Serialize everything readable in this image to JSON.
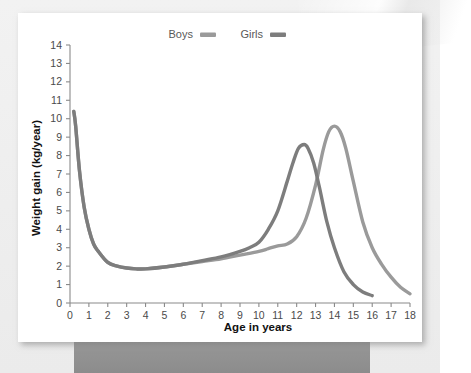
{
  "figure": {
    "background_color": "#efefef",
    "card_color": "#ffffff",
    "pedestal_color": "#939393"
  },
  "legend": {
    "position": "top-center",
    "entries": [
      {
        "label": "Boys",
        "color": "#9a9a9a",
        "swatch_name": "boys-swatch"
      },
      {
        "label": "Girls",
        "color": "#7d7d7d",
        "swatch_name": "girls-swatch"
      }
    ]
  },
  "axes": {
    "x_title": "Age in years",
    "y_title": "Weight gain (kg/year)",
    "x_ticks": [
      "0",
      "1",
      "2",
      "3",
      "4",
      "5",
      "6",
      "7",
      "8",
      "9",
      "10",
      "11",
      "12",
      "13",
      "14",
      "15",
      "16",
      "17",
      "18"
    ],
    "y_ticks": [
      "0",
      "1",
      "2",
      "3",
      "4",
      "5",
      "6",
      "7",
      "8",
      "9",
      "10",
      "11",
      "12",
      "13",
      "14"
    ],
    "axis_color": "#8a8a8a"
  },
  "chart_data": {
    "type": "line",
    "title": "",
    "xlabel": "Age in years",
    "ylabel": "Weight gain (kg/year)",
    "xlim": [
      0,
      18
    ],
    "ylim": [
      0,
      14
    ],
    "grid": false,
    "legend_position": "top-center",
    "x_ticks": [
      0,
      1,
      2,
      3,
      4,
      5,
      6,
      7,
      8,
      9,
      10,
      11,
      12,
      13,
      14,
      15,
      16,
      17,
      18
    ],
    "y_ticks": [
      0,
      1,
      2,
      3,
      4,
      5,
      6,
      7,
      8,
      9,
      10,
      11,
      12,
      13,
      14
    ],
    "series": [
      {
        "name": "Boys",
        "color": "#9a9a9a",
        "x": [
          0.2,
          0.3,
          0.5,
          0.75,
          1.0,
          1.25,
          1.5,
          2.0,
          2.5,
          3.0,
          3.5,
          4.0,
          5.0,
          6.0,
          7.0,
          8.0,
          9.0,
          10.0,
          10.5,
          11.0,
          11.5,
          12.0,
          12.5,
          13.0,
          13.4,
          13.7,
          14.0,
          14.3,
          14.6,
          15.0,
          15.5,
          16.0,
          16.5,
          17.0,
          17.5,
          18.0
        ],
        "y": [
          10.4,
          9.6,
          7.2,
          5.2,
          4.0,
          3.2,
          2.8,
          2.2,
          2.0,
          1.9,
          1.85,
          1.85,
          1.95,
          2.1,
          2.25,
          2.4,
          2.6,
          2.8,
          2.95,
          3.1,
          3.2,
          3.6,
          4.6,
          6.4,
          8.3,
          9.3,
          9.6,
          9.3,
          8.4,
          6.6,
          4.4,
          3.0,
          2.1,
          1.4,
          0.85,
          0.5
        ]
      },
      {
        "name": "Girls",
        "color": "#7d7d7d",
        "x": [
          0.2,
          0.3,
          0.5,
          0.75,
          1.0,
          1.25,
          1.5,
          2.0,
          2.5,
          3.0,
          3.5,
          4.0,
          5.0,
          6.0,
          7.0,
          8.0,
          9.0,
          9.5,
          10.0,
          10.5,
          11.0,
          11.5,
          11.8,
          12.1,
          12.4,
          12.6,
          12.9,
          13.2,
          13.6,
          14.0,
          14.5,
          15.0,
          15.5,
          16.0
        ],
        "y": [
          10.4,
          9.6,
          7.2,
          5.2,
          4.0,
          3.2,
          2.8,
          2.2,
          2.0,
          1.9,
          1.85,
          1.85,
          1.95,
          2.1,
          2.3,
          2.5,
          2.8,
          3.0,
          3.3,
          4.0,
          5.0,
          6.6,
          7.6,
          8.4,
          8.6,
          8.4,
          7.6,
          6.3,
          4.4,
          3.0,
          1.7,
          1.0,
          0.6,
          0.4
        ]
      }
    ],
    "annotations": [
      {
        "text": "Boys peak ~9.6 kg/year near age 14"
      },
      {
        "text": "Girls peak ~8.6 kg/year near age 12.5"
      },
      {
        "text": "Infant peak ~10.4 kg/year near birth"
      },
      {
        "text": "Childhood trough ~1.85 kg/year around ages 3.5-4"
      }
    ]
  }
}
